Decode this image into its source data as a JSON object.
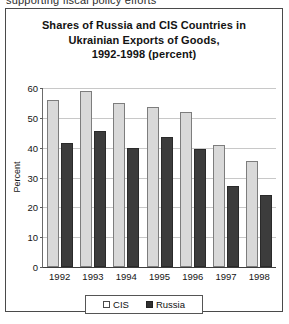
{
  "scan_artifact": {
    "text": "supporting fiscal policy efforts"
  },
  "figure": {
    "title_lines": [
      "Shares of Russia and CIS Countries in",
      "Ukrainian Exports of Goods,",
      "1992-1998 (percent)"
    ]
  },
  "colors": {
    "cis_fill": "#d9d9d9",
    "cis_border": "#7d7d7d",
    "russia_fill": "#3c3c3c",
    "russia_border": "#2a2a2a",
    "gridline": "#c8c8c8",
    "frame": "#4a4a4a",
    "text": "#151515"
  },
  "chart_data": {
    "type": "bar",
    "title": "Shares of Russia and CIS Countries in Ukrainian Exports of Goods, 1992-1998 (percent)",
    "xlabel": "",
    "ylabel": "Percent",
    "ylim": [
      0,
      60
    ],
    "yticks": [
      0,
      10,
      20,
      30,
      40,
      50,
      60
    ],
    "ytick_labels": [
      "0",
      "10",
      "20",
      "30",
      "40",
      "50",
      "60"
    ],
    "grid": true,
    "legend_position": "bottom",
    "categories": [
      "1992",
      "1993",
      "1994",
      "1995",
      "1996",
      "1997",
      "1998"
    ],
    "series": [
      {
        "name": "CIS",
        "values": [
          56,
          59,
          55,
          53.5,
          52,
          41,
          35.5
        ]
      },
      {
        "name": "Russia",
        "values": [
          41.5,
          45.5,
          40,
          43.5,
          39.5,
          27,
          24
        ]
      }
    ]
  },
  "legend": {
    "entries": [
      {
        "label": "CIS"
      },
      {
        "label": "Russia"
      }
    ]
  }
}
